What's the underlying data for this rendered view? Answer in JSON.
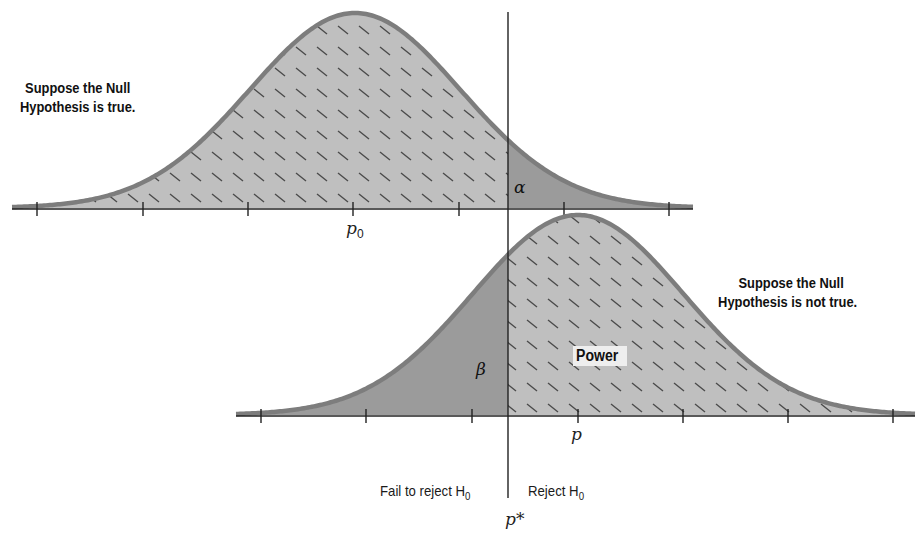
{
  "chart_data": {
    "type": "area",
    "title": "",
    "colors": {
      "light_fill": "#bfbfbf",
      "dark_fill": "#9b9b9b",
      "curve_stroke": "#7d7d7d",
      "axis": "#222222",
      "hatch": "#4a4a4a",
      "power_box": "#eeeeee"
    },
    "critical_value": {
      "label": "p*",
      "x": 508
    },
    "series": [
      {
        "name": "Null distribution",
        "caption_line1": "Suppose the Null",
        "caption_line2": "Hypothesis is true.",
        "center_label": "p",
        "center_sub": "0",
        "mean_px": 355,
        "sigma_px": 105.3,
        "baseline_y": 208,
        "peak_y": 13,
        "axis_x_range": [
          12,
          693
        ],
        "tick_x": [
          37,
          143,
          248,
          353,
          459,
          564,
          669
        ],
        "shaded_region": {
          "label": "α",
          "side": "right of p*"
        }
      },
      {
        "name": "Alternative distribution",
        "caption_line1": "Suppose the Null",
        "caption_line2": "Hypothesis is not true.",
        "center_label": "p",
        "mean_px": 578,
        "sigma_px": 105.3,
        "baseline_y": 415,
        "peak_y": 215,
        "axis_x_range": [
          236,
          915
        ],
        "tick_x": [
          261,
          366,
          472,
          578,
          683,
          788,
          893
        ],
        "shaded_region": {
          "label": "β",
          "side": "left of p*"
        },
        "hatched_region": {
          "label": "Power",
          "side": "right of p*"
        }
      }
    ],
    "decision_labels": {
      "fail": "Fail to reject H",
      "fail_sub": "0",
      "reject": "Reject H",
      "reject_sub": "0"
    }
  }
}
